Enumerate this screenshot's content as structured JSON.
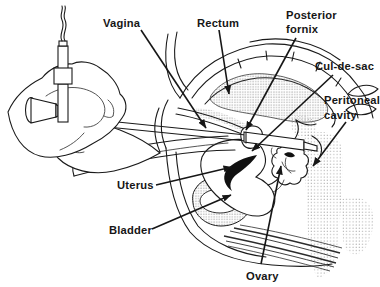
{
  "labels": {
    "vagina": "Vagina",
    "rectum": "Rectum",
    "posterior_fornix_1": "Posterior",
    "posterior_fornix_2": "fornix",
    "cul_de_sac": "Cul-de-sac",
    "peritoneal_1": "Peritoneal",
    "peritoneal_2": "cavity",
    "uterus": "Uterus",
    "bladder": "Bladder",
    "ovary": "Ovary"
  },
  "colors": {
    "ink": "#1a1a1a",
    "paper": "#ffffff",
    "stipple_dark": "#6b6b6b",
    "stipple_light": "#9a9a9a"
  }
}
